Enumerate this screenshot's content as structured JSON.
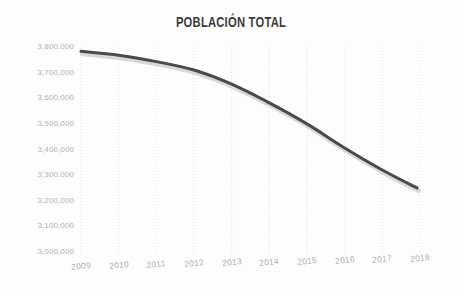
{
  "chart_data": {
    "type": "line",
    "title": "POBLACIÓN TOTAL",
    "xlabel": "",
    "ylabel": "",
    "x": [
      2009,
      2010,
      2011,
      2012,
      2013,
      2014,
      2015,
      2016,
      2017,
      2018
    ],
    "categories": [
      "2009",
      "2010",
      "2011",
      "2012",
      "2013",
      "2014",
      "2015",
      "2016",
      "2017",
      "2018"
    ],
    "values": [
      3783000,
      3768000,
      3743000,
      3710000,
      3655000,
      3582000,
      3500000,
      3406000,
      3320000,
      3250000
    ],
    "series": [
      {
        "name": "Población total",
        "values": [
          3783000,
          3768000,
          3743000,
          3710000,
          3655000,
          3582000,
          3500000,
          3406000,
          3320000,
          3250000
        ]
      }
    ],
    "ylim": [
      3000000,
      3800000
    ],
    "xlim": [
      2009,
      2018
    ],
    "ytick_labels": [
      "3,800,000",
      "3,700,000",
      "3,600,000",
      "3,500,000",
      "3,400,000",
      "3,300,000",
      "3,200,000",
      "3,100,000",
      "3,000,000"
    ],
    "ytick_values": [
      3800000,
      3700000,
      3600000,
      3500000,
      3400000,
      3300000,
      3200000,
      3100000,
      3000000
    ],
    "grid": {
      "vertical": true,
      "horizontal": false,
      "style": "dotted",
      "color": "#e2e2e2"
    },
    "legend": {
      "visible": false,
      "position": "none"
    },
    "line_color": "#4a4a4a",
    "shadow_color": "#d8d8d8",
    "background_color": "#fdfdfd",
    "label_color": "#b0b0b0",
    "title_color": "#3b3b3b",
    "line_ends_before_last_tick": true
  }
}
